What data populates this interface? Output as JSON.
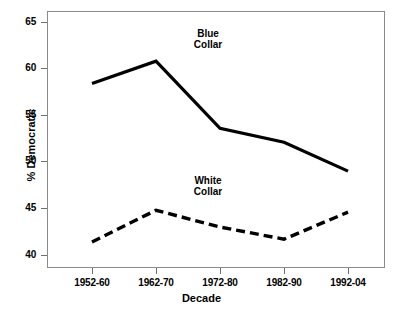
{
  "chart_data": {
    "type": "line",
    "title": "",
    "xlabel": "Decade",
    "ylabel": "% Democratic",
    "categories": [
      "1952-60",
      "1962-70",
      "1972-80",
      "1982-90",
      "1992-04"
    ],
    "ylim": [
      39,
      66
    ],
    "yticks": [
      40,
      45,
      50,
      55,
      60,
      65
    ],
    "ytick_labels": [
      "40",
      "45",
      "50",
      "55",
      "60",
      "65"
    ],
    "grid": false,
    "legend": "inline-annotations",
    "series": [
      {
        "name": "Blue Collar",
        "style": "solid",
        "color": "#000000",
        "values": [
          58.4,
          60.8,
          53.6,
          52.1,
          49.0
        ]
      },
      {
        "name": "White Collar",
        "style": "dashed",
        "color": "#000000",
        "values": [
          41.4,
          44.8,
          43.0,
          41.7,
          44.6
        ]
      }
    ],
    "annotations": [
      {
        "id": "blue",
        "text": "Blue\nCollar"
      },
      {
        "id": "white",
        "text": "White\nCollar"
      }
    ]
  },
  "axis": {
    "y_title": "% Democratic",
    "x_title": "Decade",
    "y_labels": {
      "t0": "40",
      "t1": "45",
      "t2": "50",
      "t3": "55",
      "t4": "60",
      "t5": "65"
    },
    "x_labels": {
      "c0": "1952-60",
      "c1": "1962-70",
      "c2": "1972-80",
      "c3": "1982-90",
      "c4": "1992-04"
    }
  },
  "annotations": {
    "blue_collar": "Blue\nCollar",
    "white_collar": "White\nCollar"
  },
  "colors": {
    "series": "#000000",
    "frame": "#8b8b8b",
    "background": "#ffffff"
  }
}
